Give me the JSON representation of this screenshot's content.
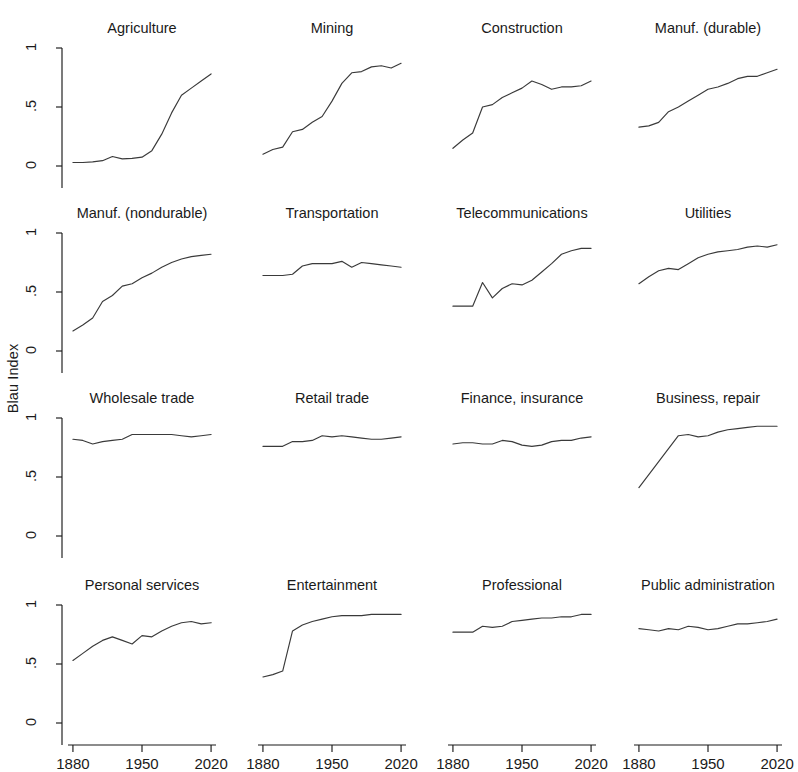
{
  "figure": {
    "ylabel": "Blau Index",
    "y_ticks": [
      "0",
      ".5",
      "1"
    ],
    "x_ticks": [
      "1880",
      "1950",
      "2020"
    ]
  },
  "chart_data": {
    "type": "line",
    "title": "",
    "xlabel": "",
    "ylabel": "Blau Index",
    "xlim": [
      1875,
      2025
    ],
    "ylim": [
      0,
      1
    ],
    "yticks": [
      0,
      0.5,
      1
    ],
    "xticks": [
      1880,
      1950,
      2020
    ],
    "grid": false,
    "legend": "none",
    "layout": {
      "rows": 4,
      "cols": 4
    },
    "panels": [
      {
        "title": "Agriculture",
        "x": [
          1880,
          1890,
          1900,
          1910,
          1920,
          1930,
          1940,
          1950,
          1960,
          1970,
          1980,
          1990,
          2000,
          2010,
          2020
        ],
        "y": [
          0.03,
          0.03,
          0.035,
          0.045,
          0.08,
          0.06,
          0.065,
          0.075,
          0.13,
          0.27,
          0.45,
          0.6,
          0.66,
          0.72,
          0.78
        ]
      },
      {
        "title": "Mining",
        "x": [
          1880,
          1890,
          1900,
          1910,
          1920,
          1930,
          1940,
          1950,
          1960,
          1970,
          1980,
          1990,
          2000,
          2010,
          2020
        ],
        "y": [
          0.1,
          0.14,
          0.16,
          0.29,
          0.31,
          0.37,
          0.42,
          0.55,
          0.7,
          0.79,
          0.8,
          0.84,
          0.85,
          0.83,
          0.87
        ]
      },
      {
        "title": "Construction",
        "x": [
          1880,
          1890,
          1900,
          1910,
          1920,
          1930,
          1940,
          1950,
          1960,
          1970,
          1980,
          1990,
          2000,
          2010,
          2020
        ],
        "y": [
          0.15,
          0.22,
          0.28,
          0.5,
          0.52,
          0.58,
          0.62,
          0.66,
          0.72,
          0.69,
          0.65,
          0.67,
          0.67,
          0.68,
          0.72
        ]
      },
      {
        "title": "Manuf. (durable)",
        "x": [
          1880,
          1890,
          1900,
          1910,
          1920,
          1930,
          1940,
          1950,
          1960,
          1970,
          1980,
          1990,
          2000,
          2010,
          2020
        ],
        "y": [
          0.33,
          0.34,
          0.37,
          0.46,
          0.5,
          0.55,
          0.6,
          0.65,
          0.67,
          0.7,
          0.74,
          0.76,
          0.76,
          0.79,
          0.82
        ]
      },
      {
        "title": "Manuf. (nondurable)",
        "x": [
          1880,
          1890,
          1900,
          1910,
          1920,
          1930,
          1940,
          1950,
          1960,
          1970,
          1980,
          1990,
          2000,
          2010,
          2020
        ],
        "y": [
          0.17,
          0.22,
          0.28,
          0.42,
          0.47,
          0.55,
          0.57,
          0.62,
          0.66,
          0.71,
          0.75,
          0.78,
          0.8,
          0.81,
          0.82
        ]
      },
      {
        "title": "Transportation",
        "x": [
          1880,
          1890,
          1900,
          1910,
          1920,
          1930,
          1940,
          1950,
          1960,
          1970,
          1980,
          1990,
          2000,
          2010,
          2020
        ],
        "y": [
          0.64,
          0.64,
          0.64,
          0.65,
          0.72,
          0.74,
          0.74,
          0.74,
          0.76,
          0.71,
          0.75,
          0.74,
          0.73,
          0.72,
          0.71
        ]
      },
      {
        "title": "Telecommunications",
        "x": [
          1880,
          1890,
          1900,
          1910,
          1920,
          1930,
          1940,
          1950,
          1960,
          1970,
          1980,
          1990,
          2000,
          2010,
          2020
        ],
        "y": [
          0.38,
          0.38,
          0.38,
          0.58,
          0.45,
          0.53,
          0.57,
          0.56,
          0.6,
          0.67,
          0.74,
          0.82,
          0.85,
          0.87,
          0.87
        ]
      },
      {
        "title": "Utilities",
        "x": [
          1880,
          1890,
          1900,
          1910,
          1920,
          1930,
          1940,
          1950,
          1960,
          1970,
          1980,
          1990,
          2000,
          2010,
          2020
        ],
        "y": [
          0.57,
          0.63,
          0.68,
          0.7,
          0.69,
          0.74,
          0.79,
          0.82,
          0.84,
          0.85,
          0.86,
          0.88,
          0.89,
          0.88,
          0.9
        ]
      },
      {
        "title": "Wholesale trade",
        "x": [
          1880,
          1890,
          1900,
          1910,
          1920,
          1930,
          1940,
          1950,
          1960,
          1970,
          1980,
          1990,
          2000,
          2010,
          2020
        ],
        "y": [
          0.82,
          0.81,
          0.78,
          0.8,
          0.81,
          0.82,
          0.86,
          0.86,
          0.86,
          0.86,
          0.86,
          0.85,
          0.84,
          0.85,
          0.86
        ]
      },
      {
        "title": "Retail trade",
        "x": [
          1880,
          1890,
          1900,
          1910,
          1920,
          1930,
          1940,
          1950,
          1960,
          1970,
          1980,
          1990,
          2000,
          2010,
          2020
        ],
        "y": [
          0.76,
          0.76,
          0.76,
          0.8,
          0.8,
          0.81,
          0.85,
          0.84,
          0.85,
          0.84,
          0.83,
          0.82,
          0.82,
          0.83,
          0.84
        ]
      },
      {
        "title": "Finance, insurance",
        "x": [
          1880,
          1890,
          1900,
          1910,
          1920,
          1930,
          1940,
          1950,
          1960,
          1970,
          1980,
          1990,
          2000,
          2010,
          2020
        ],
        "y": [
          0.78,
          0.79,
          0.79,
          0.78,
          0.78,
          0.81,
          0.8,
          0.77,
          0.76,
          0.77,
          0.8,
          0.81,
          0.81,
          0.83,
          0.84
        ]
      },
      {
        "title": "Business, repair",
        "x": [
          1880,
          1890,
          1900,
          1910,
          1920,
          1930,
          1940,
          1950,
          1960,
          1970,
          1980,
          1990,
          2000,
          2010,
          2020
        ],
        "y": [
          0.41,
          0.52,
          0.63,
          0.74,
          0.85,
          0.86,
          0.84,
          0.85,
          0.88,
          0.9,
          0.91,
          0.92,
          0.93,
          0.93,
          0.93
        ]
      },
      {
        "title": "Personal services",
        "x": [
          1880,
          1890,
          1900,
          1910,
          1920,
          1930,
          1940,
          1950,
          1960,
          1970,
          1980,
          1990,
          2000,
          2010,
          2020
        ],
        "y": [
          0.53,
          0.59,
          0.65,
          0.7,
          0.73,
          0.7,
          0.67,
          0.74,
          0.73,
          0.78,
          0.82,
          0.85,
          0.86,
          0.84,
          0.85
        ]
      },
      {
        "title": "Entertainment",
        "x": [
          1880,
          1890,
          1900,
          1910,
          1920,
          1930,
          1940,
          1950,
          1960,
          1970,
          1980,
          1990,
          2000,
          2010,
          2020
        ],
        "y": [
          0.39,
          0.41,
          0.44,
          0.78,
          0.83,
          0.86,
          0.88,
          0.9,
          0.91,
          0.91,
          0.91,
          0.92,
          0.92,
          0.92,
          0.92
        ]
      },
      {
        "title": "Professional",
        "x": [
          1880,
          1890,
          1900,
          1910,
          1920,
          1930,
          1940,
          1950,
          1960,
          1970,
          1980,
          1990,
          2000,
          2010,
          2020
        ],
        "y": [
          0.77,
          0.77,
          0.77,
          0.82,
          0.81,
          0.82,
          0.86,
          0.87,
          0.88,
          0.89,
          0.89,
          0.9,
          0.9,
          0.92,
          0.92
        ]
      },
      {
        "title": "Public administration",
        "x": [
          1880,
          1890,
          1900,
          1910,
          1920,
          1930,
          1940,
          1950,
          1960,
          1970,
          1980,
          1990,
          2000,
          2010,
          2020
        ],
        "y": [
          0.8,
          0.79,
          0.78,
          0.8,
          0.79,
          0.82,
          0.81,
          0.79,
          0.8,
          0.82,
          0.84,
          0.84,
          0.85,
          0.86,
          0.88
        ]
      }
    ]
  }
}
